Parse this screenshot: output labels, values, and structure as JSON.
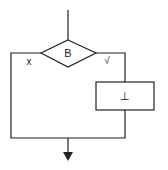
{
  "diagram": {
    "type": "flowchart",
    "decision": {
      "label": "B"
    },
    "false_branch": {
      "label": "x"
    },
    "true_branch": {
      "label": "√"
    },
    "process": {
      "label": "⊥"
    },
    "colors": {
      "line": "#222222",
      "background": "#ffffff"
    }
  }
}
